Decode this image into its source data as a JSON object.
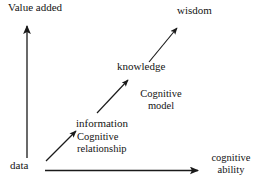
{
  "diagram": {
    "type": "dikw-hierarchy",
    "background_color": "#ffffff",
    "stroke_color": "#1a1a1a",
    "axes": {
      "y_label": "Value added",
      "x_label_line1": "cognitive",
      "x_label_line2": "ability"
    },
    "stages": [
      {
        "id": "data",
        "label": "data"
      },
      {
        "id": "information",
        "label": "information"
      },
      {
        "id": "knowledge",
        "label": "knowledge"
      },
      {
        "id": "wisdom",
        "label": "wisdom"
      }
    ],
    "processes": [
      {
        "id": "cognitive-relationship",
        "line1": "Cognitive",
        "line2": "relationship",
        "from": "data",
        "to": "information"
      },
      {
        "id": "cognitive-model",
        "line1": "Cognitive",
        "line2": "model",
        "from": "knowledge",
        "to": "wisdom"
      }
    ]
  }
}
